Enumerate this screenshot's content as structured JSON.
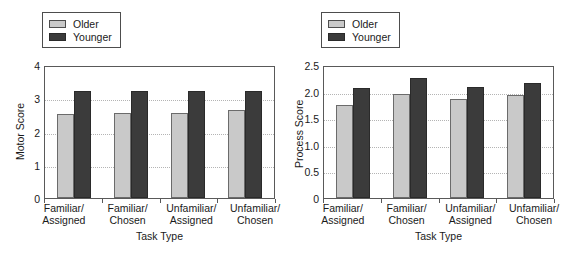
{
  "chart_data": [
    {
      "type": "bar",
      "panel": "left",
      "title": "",
      "xlabel": "Task Type",
      "ylabel": "Motor Score",
      "categories": [
        "Familiar/\nAssigned",
        "Familiar/\nChosen",
        "Unfamiliar/\nAssigned",
        "Unfamiliar/\nChosen"
      ],
      "category_lines": [
        [
          "Familiar/",
          "Assigned"
        ],
        [
          "Familiar/",
          "Chosen"
        ],
        [
          "Unfamiliar/",
          "Assigned"
        ],
        [
          "Unfamiliar/",
          "Chosen"
        ]
      ],
      "series": [
        {
          "name": "Older",
          "values": [
            2.53,
            2.57,
            2.57,
            2.66
          ],
          "color": "#c9c9c9"
        },
        {
          "name": "Younger",
          "values": [
            3.21,
            3.21,
            3.22,
            3.22
          ],
          "color": "#3b3b3b"
        }
      ],
      "ylim": [
        0,
        4
      ],
      "yticks": [
        "0",
        "1",
        "2",
        "3",
        "4"
      ],
      "ytick_values": [
        0,
        1,
        2,
        3,
        4
      ],
      "grid": true,
      "grid_style": "dotted",
      "legend_position": "above-left",
      "legend": [
        "Older",
        "Younger"
      ]
    },
    {
      "type": "bar",
      "panel": "right",
      "title": "",
      "xlabel": "Task Type",
      "ylabel": "Process Score",
      "categories": [
        "Familiar/\nAssigned",
        "Familiar/\nChosen",
        "Unfamiliar/\nAssigned",
        "Unfamiliar/\nChosen"
      ],
      "category_lines": [
        [
          "Familiar/",
          "Assigned"
        ],
        [
          "Familiar/",
          "Chosen"
        ],
        [
          "Unfamiliar/",
          "Assigned"
        ],
        [
          "Unfamiliar/",
          "Chosen"
        ]
      ],
      "series": [
        {
          "name": "Older",
          "values": [
            1.74,
            1.95,
            1.87,
            1.93
          ],
          "color": "#c9c9c9"
        },
        {
          "name": "Younger",
          "values": [
            2.06,
            2.25,
            2.09,
            2.17
          ],
          "color": "#3b3b3b"
        }
      ],
      "ylim": [
        0,
        2.5
      ],
      "yticks": [
        "0",
        "0.5",
        "1.0",
        "1.5",
        "2.0",
        "2.5"
      ],
      "ytick_values": [
        0,
        0.5,
        1.0,
        1.5,
        2.0,
        2.5
      ],
      "grid": true,
      "grid_style": "dotted",
      "legend_position": "above-left",
      "legend": [
        "Older",
        "Younger"
      ]
    }
  ],
  "colors": {
    "older": "#c9c9c9",
    "younger": "#3b3b3b",
    "axis": "#595959",
    "grid": "#b4b4b4",
    "background": "#ffffff",
    "text": "#1a1a1a"
  }
}
